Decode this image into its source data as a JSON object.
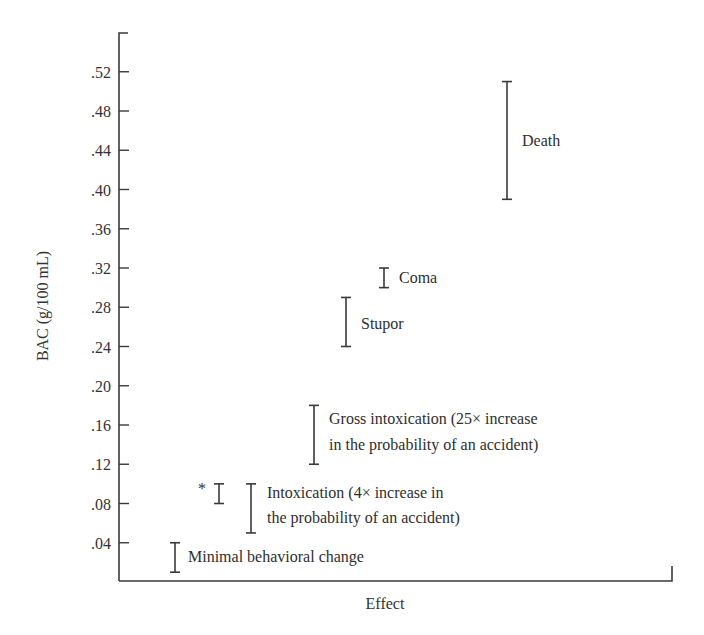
{
  "chart_data": {
    "type": "range_bar",
    "title": "",
    "xlabel": "Effect",
    "ylabel": "BAC (g/100 mL)",
    "ylim": [
      0,
      0.56
    ],
    "grid": false,
    "legend": null,
    "y_ticks": [
      ".04",
      ".08",
      ".12",
      ".16",
      ".20",
      ".24",
      ".28",
      ".32",
      ".36",
      ".40",
      ".44",
      ".48",
      ".52"
    ],
    "y_tick_values": [
      0.04,
      0.08,
      0.12,
      0.16,
      0.2,
      0.24,
      0.28,
      0.32,
      0.36,
      0.4,
      0.44,
      0.48,
      0.52
    ],
    "series": [
      {
        "name": "Minimal behavioral change",
        "label_lines": [
          "Minimal behavioral change"
        ],
        "low": 0.01,
        "high": 0.04
      },
      {
        "name": "*",
        "label_lines": [
          "*"
        ],
        "low": 0.08,
        "high": 0.1,
        "annotation": "asterisk"
      },
      {
        "name": "Intoxication (4× increase in the probability of an accident)",
        "label_lines": [
          "Intoxication (4× increase in",
          "the probability of an accident)"
        ],
        "low": 0.05,
        "high": 0.1
      },
      {
        "name": "Gross intoxication (25× increase in the probability of an accident)",
        "label_lines": [
          "Gross intoxication (25× increase",
          "in the probability of an accident)"
        ],
        "low": 0.12,
        "high": 0.18
      },
      {
        "name": "Stupor",
        "label_lines": [
          "Stupor"
        ],
        "low": 0.24,
        "high": 0.29
      },
      {
        "name": "Coma",
        "label_lines": [
          "Coma"
        ],
        "low": 0.3,
        "high": 0.32
      },
      {
        "name": "Death",
        "label_lines": [
          "Death"
        ],
        "low": 0.39,
        "high": 0.51
      }
    ]
  },
  "colors": {
    "ink": "#2e2e2e",
    "background": "#ffffff"
  }
}
